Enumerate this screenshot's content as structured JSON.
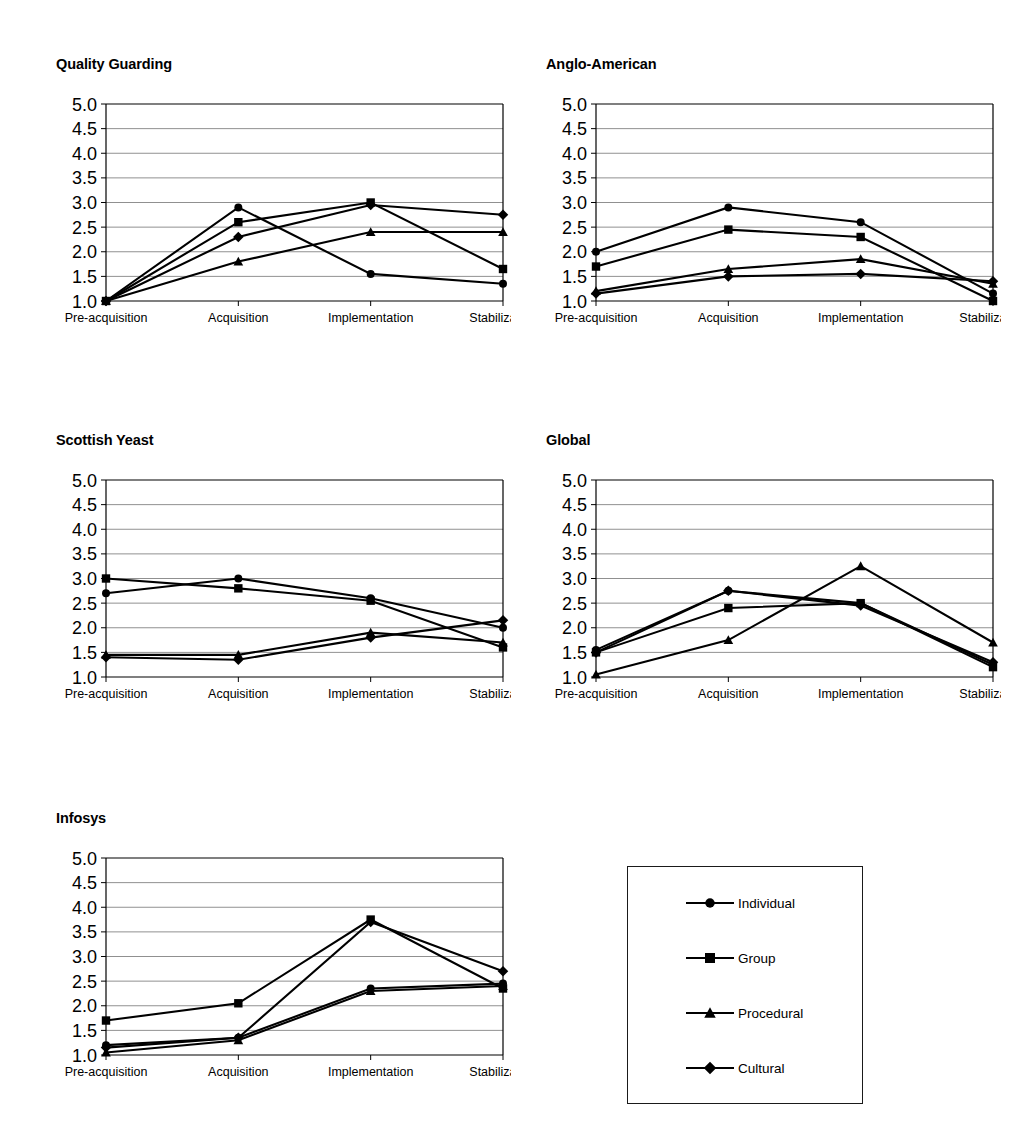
{
  "page": {
    "background": "#ffffff",
    "line_color": "#000000",
    "axis_color": "#000000",
    "grid_color": "#808080"
  },
  "axis": {
    "categories": [
      "Pre-acquisition",
      "Acquisition",
      "Implementation",
      "Stabilization"
    ],
    "y_ticks": [
      "5.0",
      "4.5",
      "4.0",
      "3.5",
      "3.0",
      "2.5",
      "2.0",
      "1.5",
      "1.0"
    ],
    "ylim": [
      1.0,
      5.0
    ],
    "ystep": 0.5,
    "grid": true
  },
  "legend": {
    "position": "bottom-right",
    "entries": [
      {
        "label": "Individual",
        "marker": "circle"
      },
      {
        "label": "Group",
        "marker": "square"
      },
      {
        "label": "Procedural",
        "marker": "triangle"
      },
      {
        "label": "Cultural",
        "marker": "diamond"
      }
    ]
  },
  "chart_data": [
    {
      "type": "line",
      "title": "Quality Guarding",
      "xlabel": "",
      "ylabel": "",
      "categories": [
        "Pre-acquisition",
        "Acquisition",
        "Implementation",
        "Stabilization"
      ],
      "ylim": [
        1.0,
        5.0
      ],
      "grid": true,
      "series": [
        {
          "name": "Individual",
          "marker": "circle",
          "values": [
            1.0,
            2.9,
            1.55,
            1.35
          ]
        },
        {
          "name": "Group",
          "marker": "square",
          "values": [
            1.0,
            2.6,
            3.0,
            1.65
          ]
        },
        {
          "name": "Procedural",
          "marker": "triangle",
          "values": [
            1.0,
            1.8,
            2.4,
            2.4
          ]
        },
        {
          "name": "Cultural",
          "marker": "diamond",
          "values": [
            1.0,
            2.3,
            2.95,
            2.75
          ]
        }
      ]
    },
    {
      "type": "line",
      "title": "Anglo-American",
      "xlabel": "",
      "ylabel": "",
      "categories": [
        "Pre-acquisition",
        "Acquisition",
        "Implementation",
        "Stabilization"
      ],
      "ylim": [
        1.0,
        5.0
      ],
      "grid": true,
      "series": [
        {
          "name": "Individual",
          "marker": "circle",
          "values": [
            2.0,
            2.9,
            2.6,
            1.15
          ]
        },
        {
          "name": "Group",
          "marker": "square",
          "values": [
            1.7,
            2.45,
            2.3,
            1.0
          ]
        },
        {
          "name": "Procedural",
          "marker": "triangle",
          "values": [
            1.2,
            1.65,
            1.85,
            1.35
          ]
        },
        {
          "name": "Cultural",
          "marker": "diamond",
          "values": [
            1.15,
            1.5,
            1.55,
            1.4
          ]
        }
      ]
    },
    {
      "type": "line",
      "title": "Scottish Yeast",
      "xlabel": "",
      "ylabel": "",
      "categories": [
        "Pre-acquisition",
        "Acquisition",
        "Implementation",
        "Stabilization"
      ],
      "ylim": [
        1.0,
        5.0
      ],
      "grid": true,
      "series": [
        {
          "name": "Individual",
          "marker": "circle",
          "values": [
            2.7,
            3.0,
            2.6,
            2.0
          ]
        },
        {
          "name": "Group",
          "marker": "square",
          "values": [
            3.0,
            2.8,
            2.55,
            1.6
          ]
        },
        {
          "name": "Procedural",
          "marker": "triangle",
          "values": [
            1.45,
            1.45,
            1.9,
            1.7
          ]
        },
        {
          "name": "Cultural",
          "marker": "diamond",
          "values": [
            1.4,
            1.35,
            1.8,
            2.15
          ]
        }
      ]
    },
    {
      "type": "line",
      "title": "Global",
      "xlabel": "",
      "ylabel": "",
      "categories": [
        "Pre-acquisition",
        "Acquisition",
        "Implementation",
        "Stabilization"
      ],
      "ylim": [
        1.0,
        5.0
      ],
      "grid": true,
      "series": [
        {
          "name": "Individual",
          "marker": "circle",
          "values": [
            1.55,
            2.75,
            2.5,
            1.25
          ]
        },
        {
          "name": "Group",
          "marker": "square",
          "values": [
            1.5,
            2.4,
            2.5,
            1.2
          ]
        },
        {
          "name": "Procedural",
          "marker": "triangle",
          "values": [
            1.05,
            1.75,
            3.25,
            1.7
          ]
        },
        {
          "name": "Cultural",
          "marker": "diamond",
          "values": [
            1.5,
            2.75,
            2.45,
            1.3
          ]
        }
      ]
    },
    {
      "type": "line",
      "title": "Infosys",
      "xlabel": "",
      "ylabel": "",
      "categories": [
        "Pre-acquisition",
        "Acquisition",
        "Implementation",
        "Stabilization"
      ],
      "ylim": [
        1.0,
        5.0
      ],
      "grid": true,
      "series": [
        {
          "name": "Individual",
          "marker": "circle",
          "values": [
            1.2,
            1.35,
            2.35,
            2.45
          ]
        },
        {
          "name": "Group",
          "marker": "square",
          "values": [
            1.7,
            2.05,
            3.75,
            2.35
          ]
        },
        {
          "name": "Procedural",
          "marker": "triangle",
          "values": [
            1.05,
            1.3,
            2.3,
            2.4
          ]
        },
        {
          "name": "Cultural",
          "marker": "diamond",
          "values": [
            1.15,
            1.35,
            3.7,
            2.7
          ]
        }
      ]
    }
  ]
}
